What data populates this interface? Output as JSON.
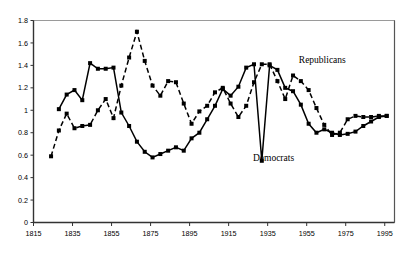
{
  "chart_data": {
    "type": "line",
    "title": "",
    "subtitle": "",
    "xlabel": "",
    "ylabel": "",
    "xlim": [
      1815,
      2000
    ],
    "ylim": [
      0,
      1.8
    ],
    "xticks": [
      "1815",
      "1835",
      "1855",
      "1875",
      "1895",
      "1915",
      "1935",
      "1955",
      "1975",
      "1995"
    ],
    "xtick_values": [
      1815,
      1835,
      1855,
      1875,
      1895,
      1915,
      1935,
      1955,
      1975,
      1995
    ],
    "yticks": [
      "0",
      "0.2",
      "0.4",
      "0.6",
      "0.8",
      "1",
      "1.2",
      "1.4",
      "1.6",
      "1.8"
    ],
    "ytick_values": [
      0,
      0.2,
      0.4,
      0.6,
      0.8,
      1.0,
      1.2,
      1.4,
      1.6,
      1.8
    ],
    "grid": false,
    "legend_position": "inline-annotation",
    "series": [
      {
        "name": "Republicans",
        "style": "solid",
        "marker": "square",
        "color": "#000000",
        "label_x": 1963,
        "label_y": 1.42,
        "points": [
          [
            1828,
            1.01
          ],
          [
            1832,
            1.14
          ],
          [
            1836,
            1.18
          ],
          [
            1840,
            1.09
          ],
          [
            1844,
            1.42
          ],
          [
            1848,
            1.37
          ],
          [
            1852,
            1.37
          ],
          [
            1856,
            1.38
          ],
          [
            1860,
            0.98
          ],
          [
            1864,
            0.86
          ],
          [
            1868,
            0.72
          ],
          [
            1872,
            0.63
          ],
          [
            1876,
            0.58
          ],
          [
            1880,
            0.61
          ],
          [
            1884,
            0.64
          ],
          [
            1888,
            0.67
          ],
          [
            1892,
            0.64
          ],
          [
            1896,
            0.75
          ],
          [
            1900,
            0.8
          ],
          [
            1904,
            0.92
          ],
          [
            1908,
            1.04
          ],
          [
            1912,
            1.19
          ],
          [
            1916,
            1.13
          ],
          [
            1920,
            1.21
          ],
          [
            1924,
            1.38
          ],
          [
            1928,
            1.41
          ],
          [
            1932,
            0.55
          ],
          [
            1936,
            1.4
          ],
          [
            1940,
            1.36
          ],
          [
            1944,
            1.2
          ],
          [
            1948,
            1.17
          ],
          [
            1952,
            1.05
          ],
          [
            1956,
            0.88
          ],
          [
            1960,
            0.8
          ],
          [
            1964,
            0.83
          ],
          [
            1968,
            0.8
          ],
          [
            1972,
            0.78
          ],
          [
            1976,
            0.79
          ],
          [
            1980,
            0.81
          ],
          [
            1984,
            0.86
          ],
          [
            1988,
            0.9
          ],
          [
            1992,
            0.94
          ],
          [
            1996,
            0.95
          ]
        ]
      },
      {
        "name": "Democrats",
        "style": "dashed",
        "marker": "square",
        "color": "#000000",
        "label_x": 1938,
        "label_y": 0.55,
        "points": [
          [
            1824,
            0.59
          ],
          [
            1828,
            0.82
          ],
          [
            1832,
            0.97
          ],
          [
            1836,
            0.84
          ],
          [
            1840,
            0.86
          ],
          [
            1844,
            0.87
          ],
          [
            1848,
            1.0
          ],
          [
            1852,
            1.1
          ],
          [
            1856,
            0.93
          ],
          [
            1860,
            1.22
          ],
          [
            1864,
            1.47
          ],
          [
            1868,
            1.7
          ],
          [
            1872,
            1.44
          ],
          [
            1876,
            1.22
          ],
          [
            1880,
            1.13
          ],
          [
            1884,
            1.26
          ],
          [
            1888,
            1.25
          ],
          [
            1892,
            1.06
          ],
          [
            1896,
            0.88
          ],
          [
            1900,
            0.99
          ],
          [
            1904,
            1.04
          ],
          [
            1908,
            1.16
          ],
          [
            1912,
            1.2
          ],
          [
            1916,
            1.06
          ],
          [
            1920,
            0.94
          ],
          [
            1924,
            1.04
          ],
          [
            1928,
            1.25
          ],
          [
            1932,
            1.41
          ],
          [
            1936,
            1.41
          ],
          [
            1940,
            1.26
          ],
          [
            1944,
            1.1
          ],
          [
            1948,
            1.31
          ],
          [
            1952,
            1.26
          ],
          [
            1956,
            1.18
          ],
          [
            1960,
            1.02
          ],
          [
            1964,
            0.87
          ],
          [
            1968,
            0.78
          ],
          [
            1972,
            0.8
          ],
          [
            1976,
            0.92
          ],
          [
            1980,
            0.95
          ],
          [
            1984,
            0.94
          ],
          [
            1988,
            0.94
          ],
          [
            1992,
            0.95
          ],
          [
            1996,
            0.95
          ]
        ]
      }
    ]
  }
}
